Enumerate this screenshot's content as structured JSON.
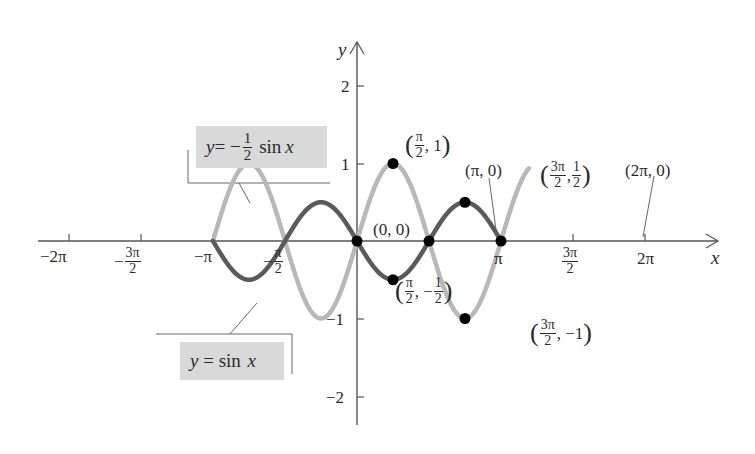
{
  "chart_data": {
    "type": "line",
    "title": "",
    "xlabel": "x",
    "ylabel": "y",
    "xlim": [
      -6.28319,
      7.54
    ],
    "ylim": [
      -2.3,
      2.6
    ],
    "grid": false,
    "x_ticks": [
      {
        "value": -6.28319,
        "label": "−2π"
      },
      {
        "value": -4.71239,
        "label": "−3π/2"
      },
      {
        "value": -3.14159,
        "label": "−π"
      },
      {
        "value": -1.5708,
        "label": "−π/2"
      },
      {
        "value": 3.14159,
        "label": "π"
      },
      {
        "value": 4.71239,
        "label": "3π/2"
      },
      {
        "value": 6.28319,
        "label": "2π"
      }
    ],
    "y_ticks": [
      {
        "value": 2,
        "label": "2"
      },
      {
        "value": 1,
        "label": "1"
      },
      {
        "value": -1,
        "label": "−1"
      },
      {
        "value": -2,
        "label": "−2"
      }
    ],
    "series": [
      {
        "name": "y = sin x",
        "function": "sin(x)",
        "domain": [
          -6.28319,
          7.5
        ],
        "color": "#b8b8b8",
        "line_width": 4
      },
      {
        "name": "y = −1/2 sin x",
        "function": "-0.5*sin(x)",
        "domain": [
          -6.28319,
          6.28319
        ],
        "color": "#5a5a5a",
        "line_width": 4
      }
    ],
    "points": [
      {
        "x": 0,
        "y": 0,
        "label": "(0, 0)"
      },
      {
        "x": 1.5708,
        "y": 1,
        "label": "(π/2, 1)"
      },
      {
        "x": 1.5708,
        "y": -0.5,
        "label": "(π/2, −1/2)"
      },
      {
        "x": 3.14159,
        "y": 0,
        "label": "(π, 0)"
      },
      {
        "x": 4.71239,
        "y": 0.5,
        "label": "(3π/2, 1/2)"
      },
      {
        "x": 4.71239,
        "y": -1,
        "label": "(3π/2, −1)"
      },
      {
        "x": 6.28319,
        "y": 0,
        "label": "(2π, 0)"
      }
    ],
    "legend": [
      {
        "text": "y = −1/2 sin x",
        "series": "y = −1/2 sin x"
      },
      {
        "text": "y = sin x",
        "series": "y = sin x"
      }
    ]
  },
  "axes": {
    "x_label": "x",
    "y_label": "y"
  },
  "x_tick_labels": {
    "neg_two_pi": "−2π",
    "neg_three_pi_half_num": "3π",
    "neg_three_pi_half_den": "2",
    "neg_pi": "−π",
    "neg_pi_half_num": "π",
    "neg_pi_half_den": "2",
    "pi": "π",
    "three_pi_half_num": "3π",
    "three_pi_half_den": "2",
    "two_pi": "2π",
    "minus": "−"
  },
  "y_tick_labels": {
    "two": "2",
    "one": "1",
    "neg_one": "−1",
    "neg_two": "−2"
  },
  "point_labels": {
    "origin": "(0, 0)",
    "pi": "(π, 0)",
    "two_pi": "(2π, 0)",
    "pi_half_one": {
      "num": "π",
      "den": "2",
      "rest": ", 1"
    },
    "pi_half_neg_half": {
      "num": "π",
      "den": "2",
      "sep": ", −",
      "num2": "1",
      "den2": "2"
    },
    "three_pi_half_half": {
      "num": "3π",
      "den": "2",
      "sep": ",",
      "num2": "1",
      "den2": "2"
    },
    "three_pi_half_neg_one": {
      "num": "3π",
      "den": "2",
      "rest": ", −1"
    }
  },
  "legend": {
    "neg_half_sin": {
      "prefix": "y",
      "eq": " = −",
      "num": "1",
      "den": "2",
      "fn": "sin",
      "var": "x"
    },
    "sin": {
      "prefix": "y",
      "eq": " = sin ",
      "var": "x"
    }
  },
  "colors": {
    "sin": "#b8b8b8",
    "neg_half_sin": "#5a5a5a",
    "axis": "#555555",
    "legend_bg": "#d9d9d9",
    "point": "#000000"
  }
}
